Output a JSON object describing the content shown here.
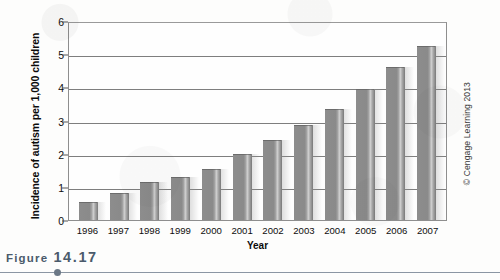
{
  "caption": {
    "label": "Figure",
    "number": "14.17"
  },
  "credit": "© Cengage Learning 2013",
  "chart_data": {
    "type": "bar",
    "title": "",
    "xlabel": "Year",
    "ylabel": "Incidence of autism per 1,000 children",
    "categories": [
      "1996",
      "1997",
      "1998",
      "1999",
      "2000",
      "2001",
      "2002",
      "2003",
      "2004",
      "2005",
      "2006",
      "2007"
    ],
    "values": [
      0.55,
      0.8,
      1.15,
      1.3,
      1.55,
      2.0,
      2.4,
      2.85,
      3.35,
      3.95,
      4.6,
      5.25
    ],
    "ylim": [
      0,
      6
    ],
    "yticks": [
      0,
      1,
      2,
      3,
      4,
      5,
      6
    ],
    "ytick_labels": [
      "0",
      "1",
      "2",
      "3",
      "4",
      "5",
      "6"
    ],
    "grid": true,
    "grid_axis": "y",
    "legend": false,
    "bar_color": "#8a8a8a",
    "axis_color": "#8e8e8e",
    "plot_background": "#fefefe"
  }
}
